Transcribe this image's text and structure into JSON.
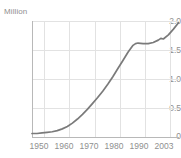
{
  "chart_data": {
    "type": "line",
    "title": "",
    "xlabel": "",
    "ylabel": "Million",
    "unit_label": "Million",
    "xlim": [
      1945,
      2003
    ],
    "ylim": [
      0,
      2.0
    ],
    "grid": true,
    "legend": "none",
    "line_color": "#7a7a7a",
    "grid_color": "#e2e2e2",
    "axis_color": "#b8b8b8",
    "text_color": "#8f8f8f",
    "y_ticks": [
      {
        "value": 2.0,
        "label": "2.0"
      },
      {
        "value": 1.5,
        "label": "1.5"
      },
      {
        "value": 1.0,
        "label": "1.0"
      },
      {
        "value": 0.5,
        "label": "0.5"
      },
      {
        "value": 0,
        "label": "0"
      }
    ],
    "x_ticks": [
      {
        "value": 1950,
        "label": "1950"
      },
      {
        "value": 1960,
        "label": "1960"
      },
      {
        "value": 1970,
        "label": "1970"
      },
      {
        "value": 1980,
        "label": "1980"
      },
      {
        "value": 1990,
        "label": "1990"
      },
      {
        "value": 2003,
        "label": "2003"
      }
    ],
    "x_gridlines": [
      1950,
      1960,
      1970,
      1980,
      1990,
      2000
    ],
    "series": [
      {
        "name": "value",
        "x": [
          1945,
          1947,
          1949,
          1951,
          1953,
          1955,
          1957,
          1959,
          1961,
          1963,
          1965,
          1967,
          1969,
          1971,
          1973,
          1975,
          1977,
          1979,
          1981,
          1983,
          1985,
          1986,
          1987,
          1989,
          1991,
          1993,
          1995,
          1996,
          1997,
          1999,
          2001,
          2003
        ],
        "values": [
          0.06,
          0.06,
          0.07,
          0.08,
          0.09,
          0.11,
          0.14,
          0.18,
          0.24,
          0.31,
          0.39,
          0.48,
          0.58,
          0.68,
          0.79,
          0.91,
          1.04,
          1.18,
          1.32,
          1.46,
          1.58,
          1.61,
          1.62,
          1.61,
          1.61,
          1.63,
          1.67,
          1.7,
          1.69,
          1.76,
          1.86,
          1.97
        ]
      }
    ]
  }
}
